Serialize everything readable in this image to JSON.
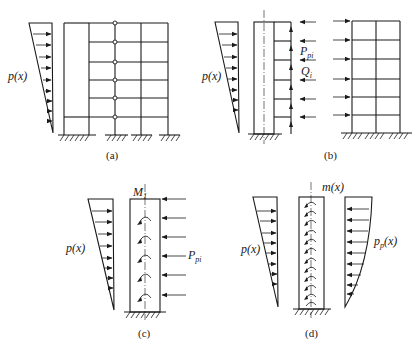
{
  "figure": {
    "panels": [
      {
        "id": "a",
        "caption": "(a)",
        "description": "Frame-shear wall structure with pin-connected links under triangular lateral load",
        "labels": {
          "load": "p(x)"
        },
        "floors": 6,
        "bays": 4
      },
      {
        "id": "b",
        "caption": "(b)",
        "description": "Separated wall and frame with link forces",
        "labels": {
          "load": "p(x)",
          "link_force_main": "P",
          "link_force_sub": "pi",
          "shear_main": "Q",
          "shear_sub": "i"
        },
        "floors": 6,
        "bays": 2
      },
      {
        "id": "c",
        "caption": "(c)",
        "description": "Wall with concentrated moments and link forces",
        "labels": {
          "load": "p(x)",
          "moment_main": "M",
          "moment_sub": "1",
          "link_force_main": "P",
          "link_force_sub": "pi"
        }
      },
      {
        "id": "d",
        "caption": "(d)",
        "description": "Continuous model with distributed moment and distributed interaction force",
        "labels": {
          "load": "p(x)",
          "moment": "m(x)",
          "interaction_main": "p",
          "interaction_sub": "p",
          "interaction_arg": "(x)"
        }
      }
    ]
  }
}
